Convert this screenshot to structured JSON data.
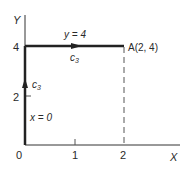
{
  "diagram": {
    "axes": {
      "x_label": "X",
      "y_label": "Y",
      "origin_label": "0",
      "x_ticks": [
        "1",
        "2"
      ],
      "y_ticks": [
        "2",
        "4"
      ]
    },
    "paths": [
      {
        "name": "c3-vertical",
        "label": "x = 0",
        "curve_label": "c",
        "curve_sub": "3",
        "from": [
          0,
          0
        ],
        "to": [
          0,
          4
        ]
      },
      {
        "name": "c3-horizontal",
        "label": "y = 4",
        "curve_label": "c",
        "curve_sub": "3",
        "from": [
          0,
          4
        ],
        "to": [
          2,
          4
        ]
      }
    ],
    "point": {
      "label": "A(2, 4)",
      "x": 2,
      "y": 4
    },
    "colors": {
      "line": "#222222",
      "text": "#2a2a2a",
      "background": "#ffffff"
    }
  }
}
